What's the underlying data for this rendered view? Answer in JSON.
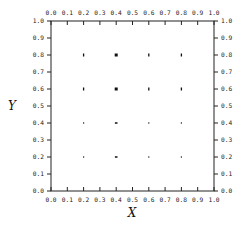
{
  "chart_data": {
    "type": "scatter",
    "title": "",
    "xlabel": "X",
    "ylabel": "Y",
    "xlim": [
      0.0,
      1.0
    ],
    "ylim": [
      0.0,
      1.0
    ],
    "grid": false,
    "legend": null,
    "x_ticks": [
      "0.0",
      "0.1",
      "0.2",
      "0.3",
      "0.4",
      "0.5",
      "0.6",
      "0.7",
      "0.8",
      "0.9",
      "1.0"
    ],
    "y_ticks": [
      "0.0",
      "0.1",
      "0.2",
      "0.3",
      "0.4",
      "0.5",
      "0.6",
      "0.7",
      "0.8",
      "0.9",
      "1.0"
    ],
    "ticks_on_all_sides": true,
    "points": [
      {
        "x": 0.2,
        "y": 0.8,
        "size": "small",
        "shape": "vbar"
      },
      {
        "x": 0.4,
        "y": 0.8,
        "size": "large",
        "shape": "square"
      },
      {
        "x": 0.6,
        "y": 0.8,
        "size": "small",
        "shape": "vbar"
      },
      {
        "x": 0.8,
        "y": 0.8,
        "size": "small",
        "shape": "vbar"
      },
      {
        "x": 0.2,
        "y": 0.6,
        "size": "small",
        "shape": "vbar"
      },
      {
        "x": 0.4,
        "y": 0.6,
        "size": "large",
        "shape": "square"
      },
      {
        "x": 0.6,
        "y": 0.6,
        "size": "small",
        "shape": "vbar"
      },
      {
        "x": 0.8,
        "y": 0.6,
        "size": "small",
        "shape": "vbar"
      },
      {
        "x": 0.2,
        "y": 0.4,
        "size": "tiny",
        "shape": "dot"
      },
      {
        "x": 0.4,
        "y": 0.4,
        "size": "small",
        "shape": "hbar"
      },
      {
        "x": 0.6,
        "y": 0.4,
        "size": "tiny",
        "shape": "dot"
      },
      {
        "x": 0.8,
        "y": 0.4,
        "size": "tiny",
        "shape": "dot"
      },
      {
        "x": 0.2,
        "y": 0.2,
        "size": "tiny",
        "shape": "dot"
      },
      {
        "x": 0.4,
        "y": 0.2,
        "size": "small",
        "shape": "hbar"
      },
      {
        "x": 0.6,
        "y": 0.2,
        "size": "tiny",
        "shape": "dot"
      },
      {
        "x": 0.8,
        "y": 0.2,
        "size": "tiny",
        "shape": "dot"
      }
    ]
  }
}
